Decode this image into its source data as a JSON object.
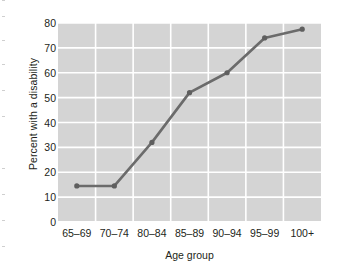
{
  "chart_data": {
    "type": "line",
    "title": "",
    "xlabel": "Age group",
    "ylabel": "Percent with a disability",
    "categories": [
      "65–69",
      "70–74",
      "80–84",
      "85–89",
      "90–94",
      "95–99",
      "100+"
    ],
    "values": [
      14.5,
      14.5,
      32,
      52,
      60,
      74,
      77.5
    ],
    "series": [
      {
        "name": "Percent with a disability",
        "values": [
          14.5,
          14.5,
          32,
          52,
          60,
          74,
          77.5
        ]
      }
    ],
    "ylim": [
      0,
      80
    ],
    "yticks": [
      0,
      10,
      20,
      30,
      40,
      50,
      60,
      70,
      80
    ],
    "ytick_labels": [
      "0",
      "10",
      "20",
      "30",
      "40",
      "50",
      "60",
      "70",
      "80"
    ],
    "grid": true,
    "grid_color": "#ffffff",
    "plot_background": "#d4d4d4",
    "line_color": "#6b6b6b",
    "marker_color": "#5f5f5f",
    "legend": "none",
    "legend_position": "none"
  },
  "figure": {
    "background": "#ffffff",
    "text_color": "#231f20"
  }
}
